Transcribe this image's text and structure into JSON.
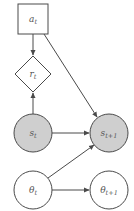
{
  "diagram": {
    "type": "graphical-model",
    "colors": {
      "stroke": "#4a4a4a",
      "observed_fill": "#cfcfcf",
      "latent_fill": "#ffffff",
      "text": "#555555"
    },
    "nodes": [
      {
        "id": "a_t",
        "base": "a",
        "sub": "t",
        "shape": "square",
        "cx": 33,
        "cy": 19,
        "size": 30,
        "fill": "#ffffff"
      },
      {
        "id": "r_t",
        "base": "r",
        "sub": "t",
        "shape": "diamond",
        "cx": 33,
        "cy": 74,
        "half": 18,
        "fill": "#ffffff"
      },
      {
        "id": "s_t",
        "base": "s",
        "sub": "t",
        "shape": "circle",
        "cx": 33,
        "cy": 133,
        "r": 19,
        "fill": "#cfcfcf"
      },
      {
        "id": "s_t1",
        "base": "s",
        "sub": "t+1",
        "shape": "circle",
        "cx": 109,
        "cy": 133,
        "r": 19,
        "fill": "#cfcfcf"
      },
      {
        "id": "theta_t",
        "base": "θ",
        "sub": "t",
        "shape": "circle",
        "cx": 33,
        "cy": 190,
        "r": 19,
        "fill": "#ffffff"
      },
      {
        "id": "theta_t1",
        "base": "θ",
        "sub": "t+1",
        "shape": "circle",
        "cx": 109,
        "cy": 190,
        "r": 19,
        "fill": "#ffffff"
      }
    ],
    "edges": [
      {
        "from": "a_t",
        "to": "r_t",
        "x1": 33,
        "y1": 34,
        "x2": 33,
        "y2": 55
      },
      {
        "from": "s_t",
        "to": "r_t",
        "x1": 33,
        "y1": 114,
        "x2": 33,
        "y2": 93
      },
      {
        "from": "a_t",
        "to": "s_t1",
        "x1": 44,
        "y1": 34,
        "x2": 97,
        "y2": 117
      },
      {
        "from": "s_t",
        "to": "s_t1",
        "x1": 52,
        "y1": 133,
        "x2": 89,
        "y2": 133
      },
      {
        "from": "theta_t",
        "to": "s_t1",
        "x1": 48,
        "y1": 178,
        "x2": 94,
        "y2": 145
      },
      {
        "from": "theta_t",
        "to": "theta_t1",
        "x1": 52,
        "y1": 190,
        "x2": 89,
        "y2": 190
      }
    ]
  }
}
